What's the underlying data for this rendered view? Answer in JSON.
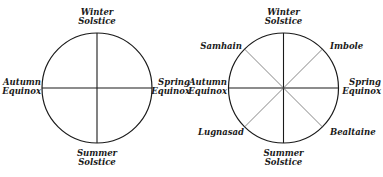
{
  "diagrams": [
    {
      "name": "solar-wheel",
      "labels": {
        "top": [
          "Winter",
          "Solstice"
        ],
        "bottom": [
          "Summer",
          "Solstice"
        ],
        "left": [
          "Autumn",
          "Equinox"
        ],
        "right": [
          "Spring",
          "Equinox"
        ]
      }
    },
    {
      "name": "wheel-of-the-year",
      "labels": {
        "top": [
          "Winter",
          "Solstice"
        ],
        "bottom": [
          "Summer",
          "Solstice"
        ],
        "left": [
          "Autumn",
          "Equinox"
        ],
        "right": [
          "Spring",
          "Equinox"
        ],
        "top_left": "Samhain",
        "top_right": "Imbole",
        "bottom_left": "Lugnasad",
        "bottom_right": "Bealtaine"
      }
    }
  ],
  "colors": {
    "line": "#1a1a1a",
    "diagonal": "#555555",
    "background": "#ffffff"
  }
}
